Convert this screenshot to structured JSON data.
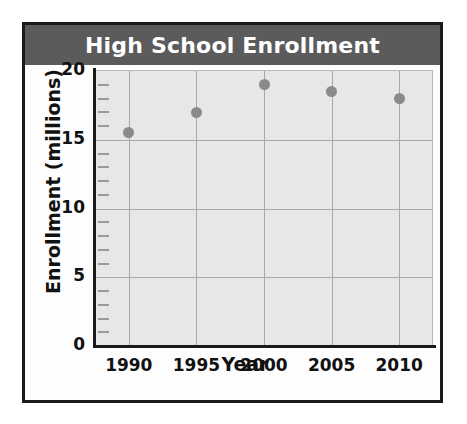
{
  "chart_data": {
    "type": "scatter",
    "title": "High School Enrollment",
    "xlabel": "Year",
    "ylabel": "Enrollment (millions)",
    "x": [
      1990,
      1995,
      2000,
      2005,
      2010
    ],
    "values": [
      15.5,
      17.0,
      19.0,
      18.5,
      18.0
    ],
    "categories": [
      "1990",
      "1995",
      "2000",
      "2005",
      "2010"
    ],
    "xtick_labels": [
      "1990",
      "1995",
      "2000",
      "2005",
      "2010"
    ],
    "ytick_labels": [
      "20",
      "15",
      "10",
      "5",
      "0"
    ],
    "ytick_values": [
      20,
      15,
      10,
      5,
      0
    ],
    "ylim": [
      0,
      20
    ],
    "xlim": [
      1987.5,
      2012.5
    ],
    "y_minor_tick_interval": 1,
    "grid": true,
    "legend": null,
    "colors": {
      "title_band": "#5b5b5b",
      "title_text": "#ffffff",
      "plot_background": "#e7e7e7",
      "gridline": "#a8a8a8",
      "axis": "#1a1a1a",
      "marker": "#8a8a8a",
      "card_border": "#1a1a1a",
      "card_background": "#fdfdfd"
    }
  }
}
